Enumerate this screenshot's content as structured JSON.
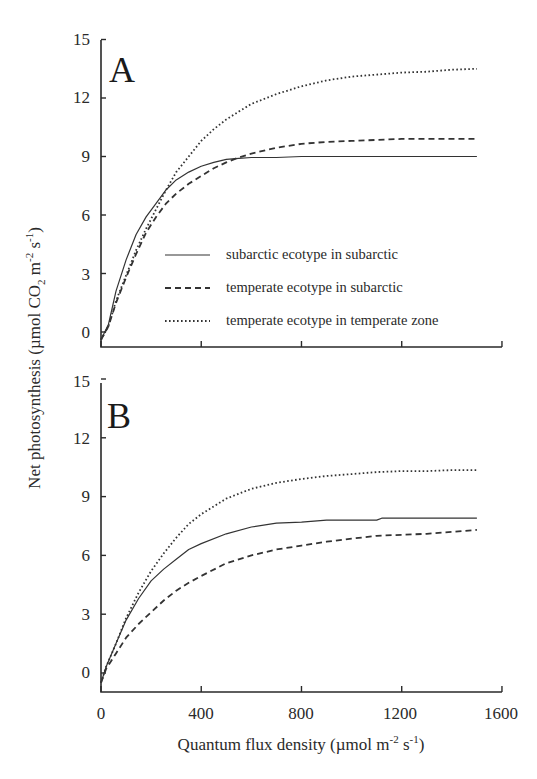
{
  "chart_data": [
    {
      "type": "line",
      "panel": "A",
      "xlabel": "Quantum flux density (µmol m-2 s-1)",
      "ylabel": "Net photosynthesis (µmol CO2 m-2 s-1)",
      "xlim": [
        0,
        1600
      ],
      "ylim": [
        -1,
        15
      ],
      "xticks": [
        0,
        400,
        800,
        1200,
        1600
      ],
      "yticks": [
        0,
        3,
        6,
        9,
        12,
        15
      ],
      "grid": false,
      "legend_position": "inside lower right",
      "series": [
        {
          "name": "subarctic ecotype in subarctic",
          "style": "solid",
          "x": [
            0,
            30,
            60,
            100,
            140,
            180,
            220,
            260,
            300,
            350,
            400,
            450,
            500,
            550,
            600,
            700,
            800,
            900,
            1000,
            1100,
            1200,
            1300,
            1400,
            1500
          ],
          "y": [
            -0.4,
            0.4,
            2.1,
            3.7,
            5.0,
            5.9,
            6.6,
            7.3,
            7.8,
            8.2,
            8.5,
            8.7,
            8.85,
            8.9,
            8.95,
            8.95,
            9.0,
            9.0,
            9.0,
            9.0,
            9.0,
            9.0,
            9.0,
            9.0
          ]
        },
        {
          "name": "temperate ecotype in subarctic",
          "style": "dashed",
          "x": [
            0,
            30,
            60,
            100,
            140,
            180,
            220,
            260,
            300,
            350,
            400,
            450,
            500,
            550,
            600,
            700,
            800,
            900,
            1000,
            1100,
            1200,
            1300,
            1400,
            1500
          ],
          "y": [
            -0.4,
            0.3,
            1.5,
            2.8,
            4.0,
            5.1,
            5.9,
            6.6,
            7.1,
            7.6,
            8.0,
            8.4,
            8.7,
            8.95,
            9.15,
            9.45,
            9.65,
            9.75,
            9.8,
            9.85,
            9.9,
            9.9,
            9.9,
            9.9
          ]
        },
        {
          "name": "temperate ecotype in temperate zone",
          "style": "dotted",
          "x": [
            0,
            30,
            60,
            100,
            140,
            180,
            220,
            260,
            300,
            350,
            400,
            450,
            500,
            550,
            600,
            700,
            800,
            900,
            1000,
            1100,
            1200,
            1300,
            1400,
            1500
          ],
          "y": [
            -0.4,
            0.3,
            1.6,
            2.9,
            4.2,
            5.3,
            6.3,
            7.3,
            8.2,
            9.0,
            9.8,
            10.4,
            10.9,
            11.3,
            11.7,
            12.2,
            12.6,
            12.9,
            13.1,
            13.2,
            13.3,
            13.35,
            13.45,
            13.5
          ]
        }
      ]
    },
    {
      "type": "line",
      "panel": "B",
      "xlabel": "Quantum flux density (µmol m-2 s-1)",
      "ylabel": "Net photosynthesis (µmol CO2 m-2 s-1)",
      "xlim": [
        0,
        1600
      ],
      "ylim": [
        -1,
        15
      ],
      "xticks": [
        0,
        400,
        800,
        1200,
        1600
      ],
      "yticks": [
        0,
        3,
        6,
        9,
        12,
        15
      ],
      "grid": false,
      "series": [
        {
          "name": "subarctic ecotype in subarctic",
          "style": "solid",
          "x": [
            0,
            20,
            60,
            100,
            150,
            200,
            250,
            300,
            350,
            400,
            500,
            600,
            700,
            800,
            900,
            1000,
            1100,
            1120,
            1200,
            1300,
            1400,
            1500
          ],
          "y": [
            -0.5,
            0.3,
            1.5,
            2.7,
            3.8,
            4.7,
            5.3,
            5.8,
            6.3,
            6.6,
            7.1,
            7.45,
            7.65,
            7.7,
            7.8,
            7.8,
            7.8,
            7.9,
            7.9,
            7.9,
            7.9,
            7.9
          ]
        },
        {
          "name": "temperate ecotype in subarctic",
          "style": "dashed",
          "x": [
            0,
            20,
            60,
            100,
            150,
            200,
            250,
            300,
            350,
            400,
            500,
            600,
            700,
            800,
            900,
            1000,
            1100,
            1200,
            1300,
            1400,
            1500
          ],
          "y": [
            -0.5,
            0.2,
            1.0,
            1.8,
            2.5,
            3.1,
            3.7,
            4.2,
            4.6,
            4.95,
            5.6,
            6.0,
            6.3,
            6.5,
            6.7,
            6.85,
            7.0,
            7.05,
            7.1,
            7.2,
            7.3
          ]
        },
        {
          "name": "temperate ecotype in temperate zone",
          "style": "dotted",
          "x": [
            0,
            20,
            60,
            100,
            150,
            200,
            250,
            300,
            350,
            400,
            500,
            600,
            700,
            800,
            900,
            1000,
            1100,
            1200,
            1300,
            1400,
            1500
          ],
          "y": [
            -0.5,
            0.3,
            1.5,
            2.8,
            4.1,
            5.2,
            6.1,
            6.9,
            7.6,
            8.1,
            8.9,
            9.4,
            9.7,
            9.9,
            10.05,
            10.15,
            10.25,
            10.3,
            10.3,
            10.35,
            10.35
          ]
        }
      ]
    }
  ],
  "panels": {
    "A": {
      "letter": "A"
    },
    "B": {
      "letter": "B"
    }
  },
  "yticks_labels": [
    "0",
    "3",
    "6",
    "9",
    "12",
    "15"
  ],
  "xticks_labels": [
    "0",
    "400",
    "800",
    "1200",
    "1600"
  ],
  "ylabel": {
    "main": "Net photosynthesis (µmol CO",
    "sub": "2",
    "mid": " m",
    "sup1": "-2",
    "mid2": " s",
    "sup2": "-1",
    "end": ")"
  },
  "xlabel": {
    "main": "Quantum flux density (µmol m",
    "sup1": "-2",
    "mid": " s",
    "sup2": "-1",
    "end": ")"
  },
  "legend": [
    {
      "label": "subarctic ecotype in subarctic",
      "style": "solid"
    },
    {
      "label": "temperate ecotype in subarctic",
      "style": "dashed"
    },
    {
      "label": "temperate ecotype in temperate zone",
      "style": "dotted"
    }
  ],
  "colors": {
    "line": "#333333",
    "axis": "#2a2a2a"
  }
}
